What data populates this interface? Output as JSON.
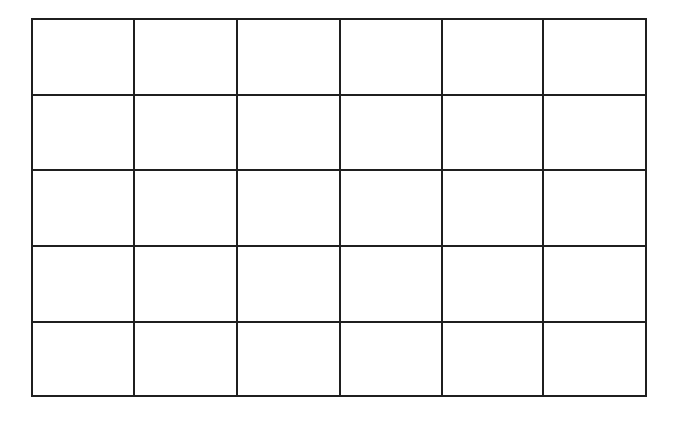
{
  "grid": {
    "rows": 5,
    "columns": 6,
    "line_color": "#1f1f1f",
    "background": "#ffffff",
    "cells": [
      [
        "",
        "",
        "",
        "",
        "",
        ""
      ],
      [
        "",
        "",
        "",
        "",
        "",
        ""
      ],
      [
        "",
        "",
        "",
        "",
        "",
        ""
      ],
      [
        "",
        "",
        "",
        "",
        "",
        ""
      ],
      [
        "",
        "",
        "",
        "",
        "",
        ""
      ]
    ]
  }
}
